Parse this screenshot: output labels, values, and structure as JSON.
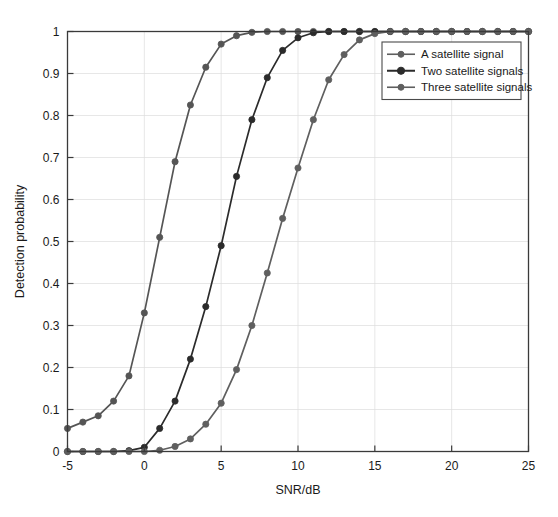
{
  "chart_data": {
    "type": "line",
    "title": "",
    "xlabel": "SNR/dB",
    "ylabel": "Detection probability",
    "xlim": [
      -5,
      25
    ],
    "ylim": [
      0,
      1
    ],
    "xticks": [
      -5,
      0,
      5,
      10,
      15,
      20,
      25
    ],
    "xtick_labels": [
      "-5",
      "0",
      "5",
      "10",
      "15",
      "20",
      "25"
    ],
    "yticks": [
      0,
      0.1,
      0.2,
      0.3,
      0.4,
      0.5,
      0.6,
      0.7,
      0.8,
      0.9,
      1
    ],
    "ytick_labels": [
      "0",
      "0.1",
      "0.2",
      "0.3",
      "0.4",
      "0.5",
      "0.6",
      "0.7",
      "0.8",
      "0.9",
      "1"
    ],
    "grid": true,
    "legend_position": "upper right",
    "x": [
      -5,
      -4,
      -3,
      -2,
      -1,
      0,
      1,
      2,
      3,
      4,
      5,
      6,
      7,
      8,
      9,
      10,
      11,
      12,
      13,
      14,
      15,
      16,
      17,
      18,
      19,
      20,
      21,
      22,
      23,
      24,
      25
    ],
    "series": [
      {
        "name": "Three satellite signals",
        "color": "#555555",
        "marker": "circle",
        "values": [
          0.055,
          0.07,
          0.085,
          0.12,
          0.18,
          0.33,
          0.51,
          0.69,
          0.825,
          0.915,
          0.97,
          0.99,
          0.998,
          1,
          1,
          1,
          1,
          1,
          1,
          1,
          1,
          1,
          1,
          1,
          1,
          1,
          1,
          1,
          1,
          1,
          1
        ]
      },
      {
        "name": "Two satellite signals",
        "color": "#2b2b2b",
        "marker": "circle",
        "values": [
          0,
          0,
          0,
          0,
          0.002,
          0.01,
          0.055,
          0.12,
          0.22,
          0.345,
          0.49,
          0.655,
          0.79,
          0.89,
          0.955,
          0.985,
          0.997,
          1,
          1,
          1,
          1,
          1,
          1,
          1,
          1,
          1,
          1,
          1,
          1,
          1,
          1
        ]
      },
      {
        "name": "A satellite signal",
        "color": "#5f5f5f",
        "marker": "circle",
        "values": [
          0,
          0,
          0,
          0,
          0,
          0,
          0.003,
          0.012,
          0.03,
          0.065,
          0.115,
          0.195,
          0.3,
          0.425,
          0.555,
          0.675,
          0.79,
          0.885,
          0.945,
          0.98,
          0.995,
          1,
          1,
          1,
          1,
          1,
          1,
          1,
          1,
          1,
          1
        ]
      }
    ],
    "legend_entries": [
      {
        "label": "A satellite signal",
        "color": "#5f5f5f"
      },
      {
        "label": "Two satellite signals",
        "color": "#2b2b2b"
      },
      {
        "label": "Three satellite signals",
        "color": "#5f5f5f"
      }
    ]
  }
}
